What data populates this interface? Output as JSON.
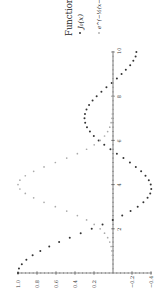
{
  "chart_data": {
    "type": "scatter",
    "title": "",
    "orientation": "rotated-90-ccw",
    "xlabel": "",
    "ylabel": "",
    "xlim": [
      0,
      10
    ],
    "ylim": [
      -0.4,
      1.0
    ],
    "grid": false,
    "legend_position": "top-right",
    "legend_title": "Functions",
    "x_ticks": [
      2,
      4,
      6,
      8,
      10
    ],
    "y_ticks": [
      1.0,
      0.8,
      0.6,
      0.4,
      0.2,
      -0.2,
      -0.4
    ],
    "y_tick_labels": [
      "1.0",
      "0.8",
      "0.6",
      "0.4",
      "0.2",
      "−0.2",
      "−0.4"
    ],
    "x": [
      0,
      0.2,
      0.4,
      0.6,
      0.8,
      1.0,
      1.2,
      1.4,
      1.6,
      1.8,
      2.0,
      2.2,
      2.4,
      2.6,
      2.8,
      3.0,
      3.2,
      3.4,
      3.6,
      3.8,
      4.0,
      4.2,
      4.4,
      4.6,
      4.8,
      5.0,
      5.2,
      5.4,
      5.6,
      5.8,
      6.0,
      6.2,
      6.4,
      6.6,
      6.8,
      7.0,
      7.2,
      7.4,
      7.6,
      7.8,
      8.0,
      8.2,
      8.4,
      8.6,
      8.8,
      9.0,
      9.2,
      9.4,
      9.6,
      9.8,
      10.0
    ],
    "series": [
      {
        "name": "J_0(x)",
        "label": "J₀(x)",
        "color": "#333333",
        "values": [
          1.0,
          0.99,
          0.96,
          0.912,
          0.846,
          0.765,
          0.671,
          0.567,
          0.455,
          0.34,
          0.224,
          0.11,
          0.003,
          -0.097,
          -0.185,
          -0.26,
          -0.32,
          -0.364,
          -0.392,
          -0.403,
          -0.397,
          -0.377,
          -0.342,
          -0.296,
          -0.24,
          -0.178,
          -0.11,
          -0.041,
          0.027,
          0.092,
          0.151,
          0.202,
          0.243,
          0.274,
          0.293,
          0.3,
          0.295,
          0.279,
          0.252,
          0.215,
          0.172,
          0.122,
          0.069,
          0.014,
          -0.041,
          -0.09,
          -0.135,
          -0.181,
          -0.214,
          -0.238,
          -0.246
        ]
      },
      {
        "name": "e^{-1/2 (x-4)^2}",
        "label": "e^(−½(x−4)²)",
        "color": "#aaaaaa",
        "values": [
          0.0003,
          0.0007,
          0.0015,
          0.0031,
          0.006,
          0.011,
          0.02,
          0.034,
          0.056,
          0.089,
          0.135,
          0.198,
          0.278,
          0.375,
          0.487,
          0.607,
          0.726,
          0.835,
          0.923,
          0.98,
          1.0,
          0.98,
          0.923,
          0.835,
          0.726,
          0.607,
          0.487,
          0.375,
          0.278,
          0.198,
          0.135,
          0.089,
          0.056,
          0.034,
          0.02,
          0.011,
          0.006,
          0.003,
          0.0015,
          0.0007,
          0.0003,
          0.0001,
          0.0001,
          0,
          0,
          0,
          0,
          0,
          0,
          0,
          0
        ]
      }
    ]
  },
  "legend": {
    "title": "Functions",
    "items": [
      {
        "label": "J₀(x)",
        "color": "#333333"
      },
      {
        "label": "e^(−½(x−4)²)",
        "color": "#aaaaaa"
      }
    ]
  }
}
